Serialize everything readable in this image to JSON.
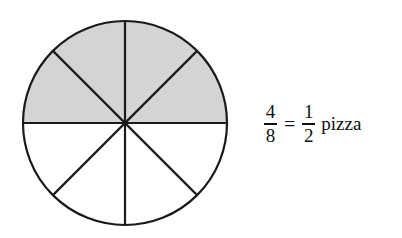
{
  "diagram": {
    "type": "fraction-circle",
    "total_slices": 8,
    "shaded_slices": 4,
    "shaded_region": "top half",
    "shade_color": "#d4d4d4",
    "line_color": "#1a1a1a"
  },
  "equation": {
    "left": {
      "numerator": "4",
      "denominator": "8"
    },
    "operator": "=",
    "right": {
      "numerator": "1",
      "denominator": "2"
    },
    "unit": "pizza"
  }
}
